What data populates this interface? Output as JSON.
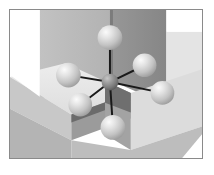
{
  "figure": {
    "domain": "scientific-illustration",
    "width_px": 214,
    "height_px": 175,
    "caption": "",
    "frame": {
      "x": 9,
      "y": 9,
      "width": 194,
      "height": 150,
      "border_color": "#8a8a8a",
      "border_width_px": 1,
      "outer_background": "#ffffff"
    }
  },
  "palette": {
    "page_white": "#ffffff",
    "block_top_face": "#e6e6e6",
    "block_top_face_alt": "#dcdcdc",
    "block_left_wall": "#b9b9b9",
    "block_left_wall_alt": "#c4c4c4",
    "block_right_wall": "#909090",
    "block_right_wall_dark": "#7e7e7e",
    "block_shadow_gap": "#6a6a6a",
    "block_shadow_deep": "#5a5a5a",
    "sphere_ligand_base": "#c9c9c9",
    "sphere_ligand_highlight": "#f4f4f4",
    "sphere_ligand_shade": "#9a9a9a",
    "sphere_center_base": "#8c8c8c",
    "sphere_center_highlight": "#bdbdbd",
    "sphere_center_shade": "#5e5e5e",
    "bond_line": "#1a1a1a"
  },
  "scene": {
    "description": "Isometric stepped crystal blocks forming a re-entrant corner; a coordination polyhedron sits at the corner.",
    "faces": [
      {
        "id": "upper-left-wall",
        "name": "upper-left-block-front-wall",
        "fill": "#b9b9b9",
        "points": "30,16 103,16 103,74 30,92"
      },
      {
        "id": "upper-right-wall",
        "name": "upper-right-block-front-wall",
        "fill": "#909090",
        "points": "103,16 160,16 160,96 103,74"
      },
      {
        "id": "upper-right-cap",
        "name": "upper-right-block-top-face",
        "fill": "#e6e6e6",
        "points": "160,30 194,30 194,96 160,96"
      },
      {
        "id": "left-slab-top",
        "name": "left-block-top-face",
        "fill": "#e6e6e6",
        "points": "2,76 64,62 128,88 66,110"
      },
      {
        "id": "left-slab-front",
        "name": "left-block-front-wall",
        "fill": "#c4c4c4",
        "points": "2,76 66,110 66,136 2,106"
      },
      {
        "id": "left-slab-side",
        "name": "left-block-side-wall",
        "fill": "#9c9c9c",
        "points": "66,110 128,88 128,112 66,136"
      },
      {
        "id": "right-slab-top",
        "name": "right-block-top-face",
        "fill": "#dcdcdc",
        "points": "128,88 194,66 194,120 128,142"
      },
      {
        "id": "right-slab-front",
        "name": "right-block-front-wall",
        "fill": "#a6a6a6",
        "points": "128,88 128,142 96,126 96,74"
      },
      {
        "id": "center-shadow",
        "name": "inner-corner-shadow",
        "fill": "#6a6a6a",
        "points": "96,74 128,88 128,112 96,100"
      }
    ]
  },
  "molecule": {
    "name": "octahedral-complex",
    "geometry": "octahedral",
    "coordination_number": 6,
    "bond_color": "#1a1a1a",
    "bond_width_px": 2,
    "central_atom": {
      "id": "center",
      "label": "central-atom",
      "cx": 110,
      "cy": 82,
      "r": 8.5,
      "shade": "dark"
    },
    "ligands": [
      {
        "id": "lig-top",
        "label": "ligand-top",
        "cx": 110,
        "cy": 37,
        "r": 12.5,
        "shade": "light"
      },
      {
        "id": "lig-upper-right",
        "label": "ligand-upper-right",
        "cx": 145,
        "cy": 65,
        "r": 12.0,
        "shade": "light"
      },
      {
        "id": "lig-left",
        "label": "ligand-left",
        "cx": 68,
        "cy": 75,
        "r": 12.5,
        "shade": "light"
      },
      {
        "id": "lig-right",
        "label": "ligand-right",
        "cx": 163,
        "cy": 93,
        "r": 12.0,
        "shade": "light"
      },
      {
        "id": "lig-lower-left",
        "label": "ligand-lower-left",
        "cx": 80,
        "cy": 105,
        "r": 12.0,
        "shade": "light"
      },
      {
        "id": "lig-bottom",
        "label": "ligand-bottom",
        "cx": 113,
        "cy": 128,
        "r": 12.5,
        "shade": "light"
      }
    ]
  }
}
